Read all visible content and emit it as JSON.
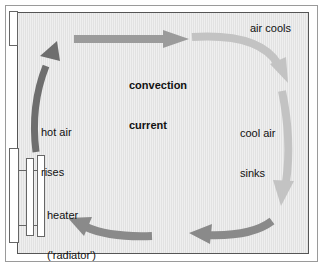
{
  "figure": {
    "room": {
      "background_color": "#e2e2e2",
      "wall_color": "#555555"
    },
    "labels": {
      "air_cools": "air cools",
      "convection_current_line1": "convection",
      "convection_current_line2": "current",
      "cool_air_line1": "cool air",
      "cool_air_line2": "sinks",
      "hot_air_line1": "hot air",
      "hot_air_line2": "rises",
      "heater_line1": "heater",
      "heater_line2": "('radiator')"
    },
    "arrows": [
      {
        "name": "hot-air-rises-arrow",
        "direction": "up",
        "color": "#6e6e6e",
        "description": "dark grey curved arrow rising from the radiator up the left side"
      },
      {
        "name": "top-arrow",
        "direction": "right",
        "color": "#9b9b9b",
        "description": "medium grey straight arrow across the top of the room"
      },
      {
        "name": "air-cools-arrow",
        "direction": "down-right",
        "color": "#c3c3c3",
        "description": "light grey curved arrow turning down at the top right"
      },
      {
        "name": "cool-air-sinks-arrow",
        "direction": "down",
        "color": "#c3c3c3",
        "description": "light grey arrow descending the right wall"
      },
      {
        "name": "bottom-right-arrow",
        "direction": "left",
        "color": "#8a8a8a",
        "description": "grey arrow travelling left along the bottom right"
      },
      {
        "name": "bottom-left-arrow",
        "direction": "left",
        "color": "#8a8a8a",
        "description": "grey arrow travelling left back toward the heater"
      }
    ],
    "parts": {
      "wall_jog": "wall-opening-top-left",
      "wall_window": "wall-window-left",
      "radiator_fin_a": "radiator-fin",
      "radiator_fin_b": "radiator-fin"
    }
  }
}
